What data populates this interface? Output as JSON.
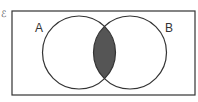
{
  "diagram": {
    "type": "venn",
    "universal_symbol": "ℰ",
    "sets": [
      {
        "label": "A",
        "cx": 79,
        "cy": 52.5,
        "r": 36.5
      },
      {
        "label": "B",
        "cx": 130,
        "cy": 52.5,
        "r": 36.5
      }
    ],
    "shaded_region": "A ∩ B",
    "colors": {
      "stroke": "#333333",
      "shade": "#555555",
      "background": "#ffffff"
    },
    "frame": {
      "x": 12,
      "y": 11,
      "width": 183,
      "height": 84
    }
  }
}
